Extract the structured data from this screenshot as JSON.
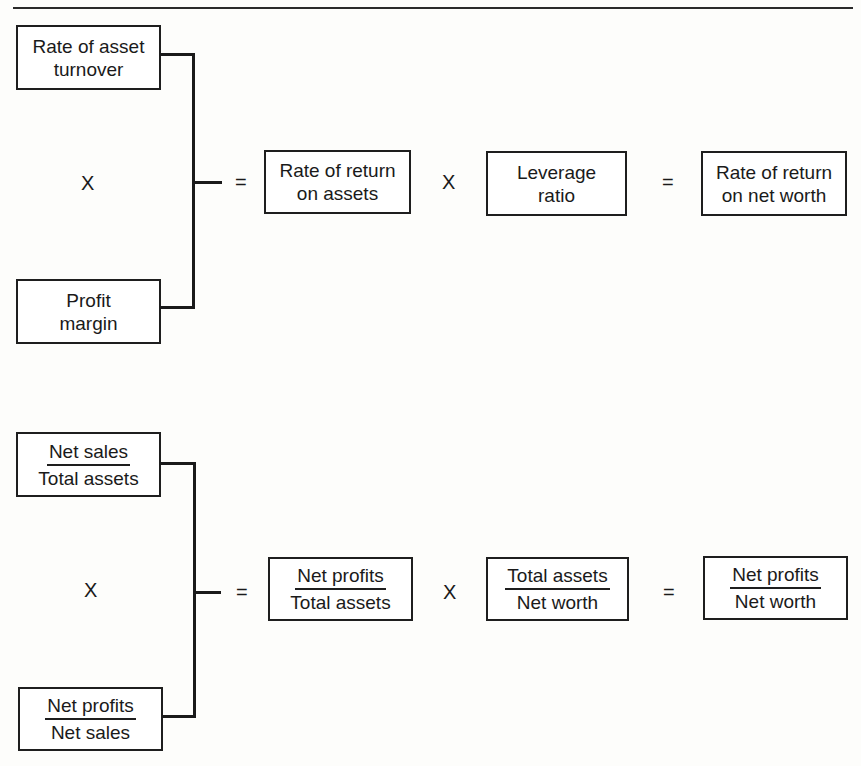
{
  "diagram": {
    "top": {
      "left_top_box": [
        "Rate of asset",
        "turnover"
      ],
      "left_op": "X",
      "left_bottom_box": [
        "Profit",
        "margin"
      ],
      "eq1": "=",
      "box_roa": [
        "Rate of return",
        "on assets"
      ],
      "times": "X",
      "box_leverage": [
        "Leverage",
        "ratio"
      ],
      "eq2": "=",
      "box_ronw": [
        "Rate of return",
        "on net worth"
      ]
    },
    "bottom": {
      "left_top_frac": {
        "num": "Net sales",
        "den": "Total assets"
      },
      "left_op": "X",
      "left_bottom_frac": {
        "num": "Net profits",
        "den": "Net sales"
      },
      "eq1": "=",
      "frac_roa": {
        "num": "Net profits",
        "den": "Total assets"
      },
      "times": "X",
      "frac_leverage": {
        "num": "Total assets",
        "den": "Net worth"
      },
      "eq2": "=",
      "frac_ronw": {
        "num": "Net profits",
        "den": "Net worth"
      }
    }
  }
}
